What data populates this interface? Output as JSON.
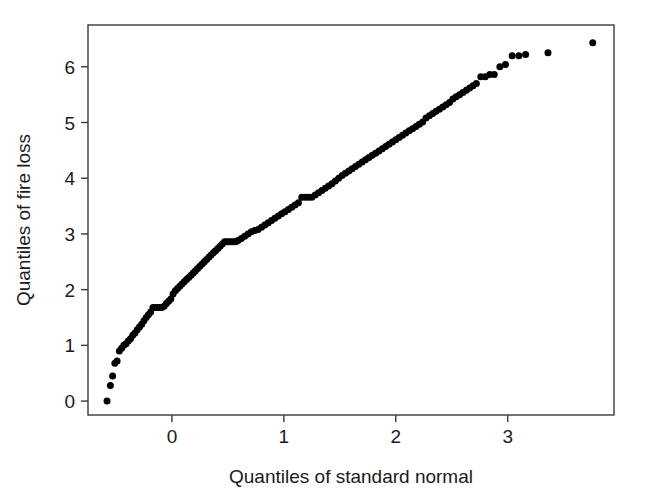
{
  "chart_data": {
    "type": "scatter",
    "title": "",
    "subtitle": "",
    "xlabel": "Quantiles of standard normal",
    "ylabel": "Quantiles of fire loss",
    "xlim": [
      -0.75,
      3.95
    ],
    "ylim": [
      -0.25,
      6.75
    ],
    "xticks": [
      0,
      1,
      2,
      3
    ],
    "yticks": [
      0,
      1,
      2,
      3,
      4,
      5,
      6
    ],
    "xtick_labels": [
      "0",
      "1",
      "2",
      "3"
    ],
    "ytick_labels": [
      "0",
      "1",
      "2",
      "3",
      "4",
      "5",
      "6"
    ],
    "grid": false,
    "legend": null,
    "marker": "filled-circle",
    "marker_color": "#000000",
    "marker_size_px": 7,
    "frame": "box",
    "annotations": [],
    "series": [
      {
        "name": "fire loss quantiles",
        "x": [
          -0.58,
          -0.55,
          -0.53,
          -0.51,
          -0.49,
          -0.47,
          -0.45,
          -0.43,
          -0.41,
          -0.39,
          -0.37,
          -0.35,
          -0.33,
          -0.31,
          -0.29,
          -0.27,
          -0.25,
          -0.23,
          -0.21,
          -0.19,
          -0.17,
          -0.15,
          -0.13,
          -0.11,
          -0.09,
          -0.07,
          -0.05,
          -0.03,
          -0.01,
          0.01,
          0.03,
          0.05,
          0.07,
          0.09,
          0.11,
          0.13,
          0.15,
          0.17,
          0.19,
          0.21,
          0.23,
          0.25,
          0.27,
          0.29,
          0.31,
          0.33,
          0.35,
          0.37,
          0.39,
          0.41,
          0.43,
          0.45,
          0.47,
          0.49,
          0.51,
          0.53,
          0.55,
          0.57,
          0.59,
          0.62,
          0.65,
          0.68,
          0.71,
          0.74,
          0.77,
          0.8,
          0.83,
          0.86,
          0.89,
          0.92,
          0.95,
          0.98,
          1.01,
          1.04,
          1.07,
          1.1,
          1.13,
          1.16,
          1.19,
          1.22,
          1.25,
          1.28,
          1.31,
          1.34,
          1.37,
          1.4,
          1.43,
          1.46,
          1.49,
          1.52,
          1.55,
          1.58,
          1.61,
          1.64,
          1.67,
          1.7,
          1.73,
          1.76,
          1.79,
          1.82,
          1.85,
          1.88,
          1.91,
          1.94,
          1.97,
          2.0,
          2.03,
          2.06,
          2.09,
          2.12,
          2.15,
          2.18,
          2.21,
          2.24,
          2.27,
          2.3,
          2.33,
          2.36,
          2.39,
          2.42,
          2.45,
          2.48,
          2.51,
          2.54,
          2.57,
          2.6,
          2.63,
          2.66,
          2.69,
          2.72,
          2.76,
          2.8,
          2.84,
          2.88,
          2.93,
          2.98,
          3.04,
          3.1,
          3.16,
          3.36,
          3.76
        ],
        "y": [
          0.0,
          0.28,
          0.45,
          0.68,
          0.72,
          0.9,
          0.95,
          1.0,
          1.03,
          1.08,
          1.12,
          1.18,
          1.22,
          1.28,
          1.33,
          1.38,
          1.44,
          1.5,
          1.55,
          1.6,
          1.68,
          1.68,
          1.68,
          1.68,
          1.68,
          1.7,
          1.75,
          1.79,
          1.83,
          1.92,
          1.98,
          2.02,
          2.06,
          2.1,
          2.14,
          2.18,
          2.22,
          2.26,
          2.3,
          2.34,
          2.38,
          2.42,
          2.46,
          2.5,
          2.54,
          2.58,
          2.62,
          2.66,
          2.7,
          2.74,
          2.78,
          2.82,
          2.86,
          2.86,
          2.86,
          2.86,
          2.86,
          2.86,
          2.88,
          2.92,
          2.96,
          3.0,
          3.04,
          3.06,
          3.08,
          3.12,
          3.16,
          3.2,
          3.24,
          3.28,
          3.32,
          3.36,
          3.4,
          3.44,
          3.48,
          3.52,
          3.56,
          3.66,
          3.66,
          3.66,
          3.66,
          3.7,
          3.74,
          3.78,
          3.82,
          3.86,
          3.9,
          3.95,
          4.0,
          4.05,
          4.09,
          4.13,
          4.17,
          4.21,
          4.25,
          4.29,
          4.33,
          4.37,
          4.41,
          4.45,
          4.49,
          4.53,
          4.57,
          4.61,
          4.65,
          4.69,
          4.73,
          4.77,
          4.81,
          4.85,
          4.89,
          4.93,
          4.97,
          5.01,
          5.08,
          5.12,
          5.16,
          5.2,
          5.24,
          5.28,
          5.32,
          5.36,
          5.42,
          5.46,
          5.5,
          5.54,
          5.58,
          5.62,
          5.66,
          5.7,
          5.82,
          5.82,
          5.86,
          5.86,
          6.0,
          6.04,
          6.2,
          6.2,
          6.22,
          6.25,
          6.43
        ]
      }
    ]
  },
  "geometry": {
    "plot_left": 88,
    "plot_right": 614,
    "plot_top": 25,
    "plot_bottom": 415,
    "tick_len": 7,
    "frame_color": "#3b3b3b",
    "frame_width": 1.4
  }
}
